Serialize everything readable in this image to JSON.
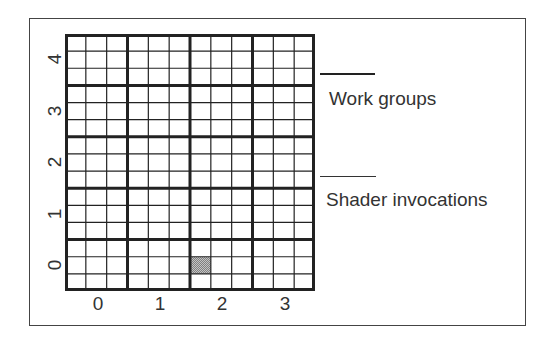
{
  "diagram": {
    "type": "compute-dispatch-grid",
    "work_groups": {
      "x_count": 4,
      "y_count": 5
    },
    "invocations_per_group": {
      "x": 3,
      "y": 3
    },
    "x_labels": [
      "0",
      "1",
      "2",
      "3"
    ],
    "y_labels": [
      "0",
      "1",
      "2",
      "3",
      "4"
    ],
    "highlighted_invocation": {
      "work_group": [
        2,
        0
      ],
      "local_invocation": [
        0,
        1
      ],
      "fill_color": "#a0a0a0"
    },
    "colors": {
      "grid_line": "#222222",
      "frame": "#444444",
      "background": "#ffffff"
    }
  },
  "legend": {
    "work_groups_label": "Work groups",
    "shader_invocations_label": "Shader invocations"
  }
}
